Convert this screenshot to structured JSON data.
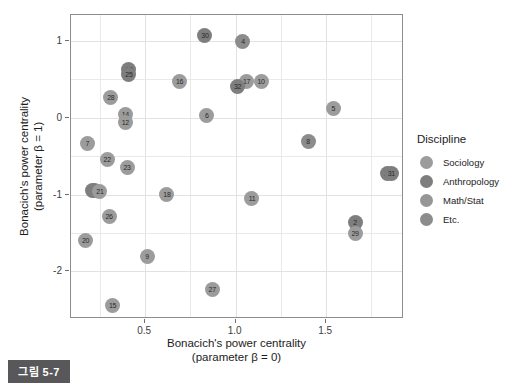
{
  "caption": {
    "badge": "그림 5-7"
  },
  "chart_data": {
    "type": "scatter",
    "title": "",
    "xlabel": "Bonacich's power centrality\n(parameter β = 0)",
    "xlabel_line1": "Bonacich's power centrality",
    "xlabel_line2": "(parameter β = 0)",
    "ylabel_line1": "Bonacich's power centrality",
    "ylabel_line2": "(parameter β = 1)",
    "xlim": [
      0.09,
      1.93
    ],
    "ylim": [
      -2.62,
      1.34
    ],
    "xticks": [
      0.5,
      1.0,
      1.5
    ],
    "xtick_labels": [
      "0.5",
      "1.0",
      "1.5"
    ],
    "yticks": [
      1,
      0,
      -1,
      -2
    ],
    "ytick_labels": [
      "1",
      "0",
      "-1",
      "-2"
    ],
    "x_minor_ticks": [
      0.25,
      0.75,
      1.25,
      1.75
    ],
    "y_minor_ticks": [
      0.5,
      -0.5,
      -1.5
    ],
    "grid": true,
    "legend_position": "right",
    "point_label_field": "label",
    "points": [
      {
        "label": "30",
        "x": 0.83,
        "y": 1.07,
        "group": "Anthropology"
      },
      {
        "label": "4",
        "x": 1.04,
        "y": 0.99,
        "group": "Etc."
      },
      {
        "label": "19",
        "x": 0.41,
        "y": 0.63,
        "group": "Anthropology"
      },
      {
        "label": "25",
        "x": 0.41,
        "y": 0.56,
        "group": "Anthropology"
      },
      {
        "label": "16",
        "x": 0.69,
        "y": 0.48,
        "group": "Sociology"
      },
      {
        "label": "17",
        "x": 1.06,
        "y": 0.47,
        "group": "Sociology"
      },
      {
        "label": "10",
        "x": 1.14,
        "y": 0.48,
        "group": "Sociology"
      },
      {
        "label": "32",
        "x": 1.01,
        "y": 0.41,
        "group": "Anthropology"
      },
      {
        "label": "28",
        "x": 0.31,
        "y": 0.27,
        "group": "Sociology"
      },
      {
        "label": "14",
        "x": 0.39,
        "y": 0.05,
        "group": "Sociology"
      },
      {
        "label": "6",
        "x": 0.84,
        "y": 0.03,
        "group": "Sociology"
      },
      {
        "label": "12",
        "x": 0.39,
        "y": -0.06,
        "group": "Sociology"
      },
      {
        "label": "5",
        "x": 1.54,
        "y": 0.12,
        "group": "Sociology"
      },
      {
        "label": "7",
        "x": 0.18,
        "y": -0.34,
        "group": "Sociology"
      },
      {
        "label": "8",
        "x": 1.4,
        "y": -0.31,
        "group": "Etc."
      },
      {
        "label": "22",
        "x": 0.29,
        "y": -0.54,
        "group": "Sociology"
      },
      {
        "label": "23",
        "x": 0.4,
        "y": -0.65,
        "group": "Sociology"
      },
      {
        "label": "24",
        "x": 1.84,
        "y": -0.73,
        "group": "Anthropology"
      },
      {
        "label": "31",
        "x": 1.86,
        "y": -0.73,
        "group": "Anthropology"
      },
      {
        "label": "13",
        "x": 0.21,
        "y": -0.95,
        "group": "Anthropology"
      },
      {
        "label": "3",
        "x": 0.22,
        "y": -0.95,
        "group": "Anthropology"
      },
      {
        "label": "21",
        "x": 0.25,
        "y": -0.96,
        "group": "Sociology"
      },
      {
        "label": "18",
        "x": 0.62,
        "y": -1.0,
        "group": "Sociology"
      },
      {
        "label": "11",
        "x": 1.09,
        "y": -1.05,
        "group": "Sociology"
      },
      {
        "label": "26",
        "x": 0.3,
        "y": -1.28,
        "group": "Sociology"
      },
      {
        "label": "2",
        "x": 1.66,
        "y": -1.36,
        "group": "Anthropology"
      },
      {
        "label": "29",
        "x": 1.66,
        "y": -1.5,
        "group": "Sociology"
      },
      {
        "label": "20",
        "x": 0.17,
        "y": -1.6,
        "group": "Sociology"
      },
      {
        "label": "9",
        "x": 0.51,
        "y": -1.81,
        "group": "Sociology"
      },
      {
        "label": "27",
        "x": 0.87,
        "y": -2.24,
        "group": "Sociology"
      },
      {
        "label": "15",
        "x": 0.32,
        "y": -2.44,
        "group": "Sociology"
      }
    ]
  },
  "legend": {
    "title": "Discipline",
    "items": [
      {
        "label": "Sociology",
        "color": "#9c9c9c"
      },
      {
        "label": "Anthropology",
        "color": "#7e7e7e"
      },
      {
        "label": "Math/Stat",
        "color": "#969696"
      },
      {
        "label": "Etc.",
        "color": "#8c8c8c"
      }
    ]
  },
  "group_colors": {
    "Sociology": "#9c9c9c",
    "Anthropology": "#7e7e7e",
    "Math/Stat": "#969696",
    "Etc.": "#8c8c8c"
  }
}
